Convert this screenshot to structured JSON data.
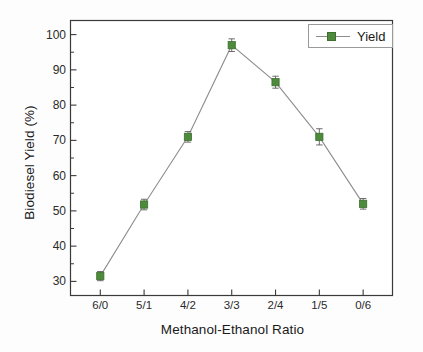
{
  "chart_data": {
    "type": "line",
    "title": "",
    "subtitle": "",
    "xlabel": "Methanol-Ethanol Ratio",
    "ylabel": "Biodiesel Yield (%)",
    "categories": [
      "6/0",
      "5/1",
      "4/2",
      "3/3",
      "2/4",
      "1/5",
      "0/6"
    ],
    "series": [
      {
        "name": "Yield",
        "values": [
          31.5,
          51.8,
          71.0,
          97.0,
          86.5,
          71.0,
          52.0
        ],
        "errors": [
          1.3,
          1.5,
          1.5,
          1.8,
          1.7,
          2.3,
          1.5
        ],
        "marker": "square",
        "marker_color": "#4e8a3b",
        "line_color": "#8d8d8d"
      }
    ],
    "ylim": [
      26,
      104
    ],
    "yticks": [
      30,
      40,
      50,
      60,
      70,
      80,
      90,
      100
    ],
    "ytick_labels": [
      "30",
      "40",
      "50",
      "60",
      "70",
      "80",
      "90",
      "100"
    ],
    "xtick_labels": [
      "6/0",
      "5/1",
      "4/2",
      "3/3",
      "2/4",
      "1/5",
      "0/6"
    ],
    "grid": false,
    "legend_position": "top-right",
    "legend_entries": [
      "Yield"
    ],
    "error_bars": true
  },
  "legend": {
    "label": "Yield"
  },
  "colors": {
    "marker": "#4e8a3b",
    "line": "#8d8d8d",
    "axis": "#3a3a3a",
    "text": "#1a1a1a",
    "background": "#fdfdfd"
  }
}
